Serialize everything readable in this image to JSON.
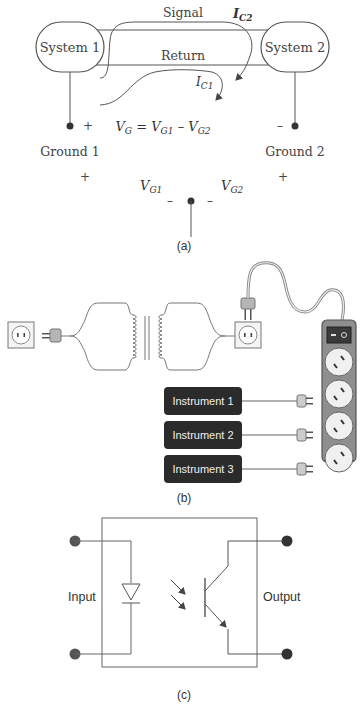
{
  "panel_a": {
    "system1": "System 1",
    "system2": "System 2",
    "signal": "Signal",
    "return": "Return",
    "ic2_main": "I",
    "ic2_sub": "C2",
    "ic1_main": "I",
    "ic1_sub": "C1",
    "equation": {
      "vg": "V",
      "vg_sub": "G",
      "eq": " = ",
      "vg1": "V",
      "vg1_sub": "G1",
      "minus": " – ",
      "vg2": "V",
      "vg2_sub": "G2"
    },
    "plus": "+",
    "minus": "–",
    "ground1": "Ground 1",
    "ground2": "Ground 2",
    "vg1_label": "V",
    "vg1_label_sub": "G1",
    "vg2_label": "V",
    "vg2_label_sub": "G2",
    "caption": "(a)"
  },
  "panel_b": {
    "instruments": [
      "Instrument 1",
      "Instrument 2",
      "Instrument 3"
    ],
    "switch_symbols": "– ○",
    "caption": "(b)"
  },
  "panel_c": {
    "input": "Input",
    "output": "Output",
    "caption": "(c)"
  },
  "colors": {
    "line": "#555555",
    "dark_box": "#2b2b2b",
    "strip_fill": "#8a8a8a",
    "outlet_fill": "#f2f2f2",
    "switch_red": "#3a3a3a"
  }
}
